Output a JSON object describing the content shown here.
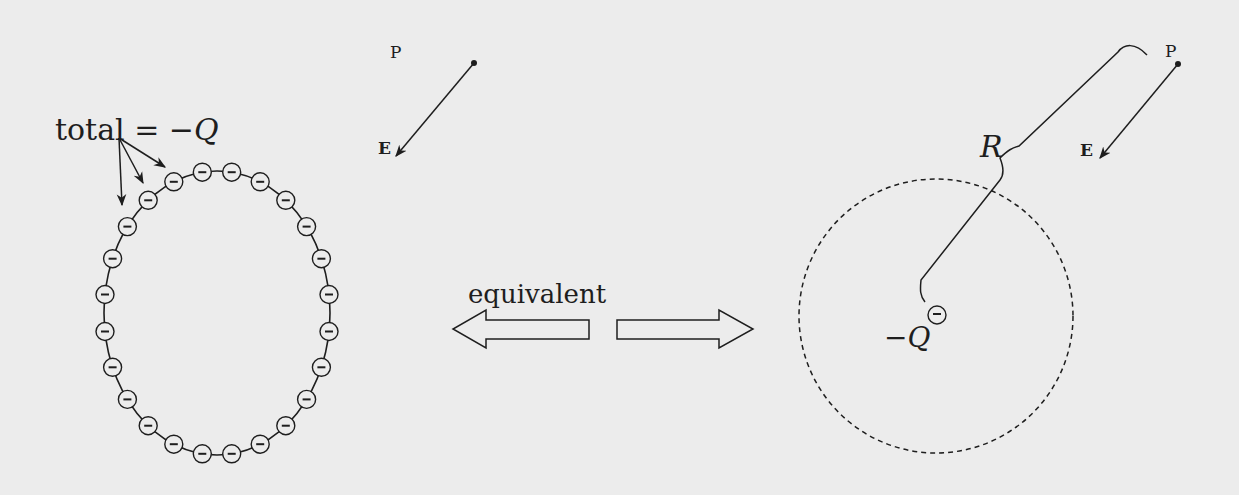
{
  "left_panel": {
    "annotation": {
      "label": "total = −Q",
      "label_prefix": "total = −",
      "label_var": "Q"
    },
    "field_point": {
      "label": "P"
    },
    "field_vector": {
      "label": "E"
    },
    "charge_symbol": "−",
    "charge_count": 24
  },
  "middle": {
    "label": "equivalent"
  },
  "right_panel": {
    "field_point": {
      "label": "P"
    },
    "field_vector": {
      "label": "E"
    },
    "distance": {
      "label": "R"
    },
    "point_charge": {
      "label_prefix": "−",
      "label_var": "Q",
      "symbol": "−"
    }
  },
  "colors": {
    "background": "#ececec",
    "ink": "#1e1e1e"
  }
}
